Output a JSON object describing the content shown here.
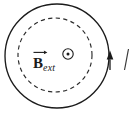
{
  "figure": {
    "kind": "physics-diagram",
    "background_color": "#ffffff",
    "stroke_color": "#1b1b1b",
    "width": 131,
    "height": 114
  },
  "labels": {
    "field_symbol": "B",
    "field_subscript": "ext",
    "current_symbol": "I"
  },
  "icons": {
    "out_of_page": "circle-dot-icon",
    "vector_arrow": "vector-arrow-icon",
    "current_arrowhead": "arrowhead-up-icon"
  },
  "geometry": {
    "conducting_loop": {
      "cx": 57,
      "cy": 56,
      "r": 52,
      "style": "solid"
    },
    "field_region": {
      "cx": 55,
      "cy": 55,
      "r": 37,
      "style": "dashed"
    },
    "out_of_page_marker": {
      "cx": 68,
      "cy": 54,
      "r_outer": 5.2,
      "r_dot": 1.5
    },
    "current_arrowhead": {
      "x": 110,
      "y": 58,
      "direction": "up"
    }
  }
}
